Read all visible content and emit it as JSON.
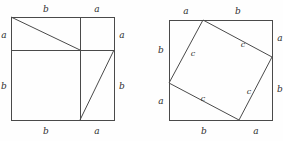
{
  "figure": {
    "background_color": "#fefefe",
    "stroke_color": "#4a4a4a",
    "text_color": "#2e2e2e",
    "labels": {
      "a": "a",
      "b": "b",
      "c": "c"
    },
    "left_square": {
      "name": "dissected-square",
      "geometry": {
        "x": 11,
        "y": 17,
        "size": 103,
        "split_x": 80,
        "split_y": 50
      },
      "edge_labels": {
        "top_left": "b",
        "top_right": "a",
        "left_upper": "a",
        "left_lower": "b",
        "right_upper": "a",
        "right_lower": "b",
        "bottom_left": "b",
        "bottom_right": "a"
      }
    },
    "right_square": {
      "name": "inscribed-tilted-square",
      "geometry": {
        "x": 169,
        "y": 20,
        "size": 103,
        "top_vertex_x": 203,
        "right_vertex_y": 57,
        "bottom_vertex_x": 239,
        "left_vertex_y": 83
      },
      "edge_labels": {
        "top_left": "a",
        "top_right": "b",
        "left_upper": "b",
        "left_lower": "a",
        "right_upper": "a",
        "right_lower": "b",
        "bottom_left": "b",
        "bottom_right": "a"
      },
      "inner_labels": {
        "upper_left": "c",
        "upper_right": "c",
        "lower_right": "c",
        "lower_left": "c"
      }
    }
  }
}
